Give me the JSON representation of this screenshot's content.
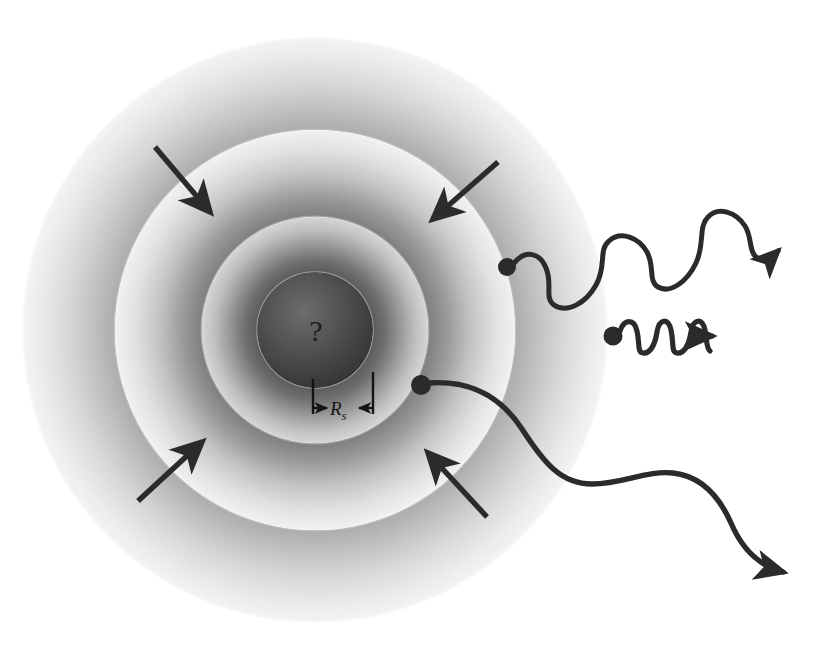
{
  "figure": {
    "kind": "gravitational-collapse-schematic",
    "background_color": "#ffffff",
    "ink_color": "#2b2b2b",
    "center": {
      "x": 315,
      "y": 330
    }
  },
  "core": {
    "label": "?",
    "label_x": 316,
    "label_y": 341,
    "radius": 58,
    "fill_dark": "#3a3a3a",
    "fill_light": "#6f6f6f"
  },
  "shells": [
    {
      "name": "outer-shell",
      "radius": 293,
      "inner_edge_color": "#b4b4b4",
      "outer_edge_color": "#f2f2f2"
    },
    {
      "name": "middle-shell",
      "radius": 200,
      "inner_edge_color": "#8d8d8d",
      "outer_edge_color": "#ededed"
    },
    {
      "name": "inner-shell",
      "radius": 113,
      "inner_edge_color": "#6a6a6a",
      "outer_edge_color": "#d6d6d6"
    }
  ],
  "dimension": {
    "label_text": "R",
    "label_subscript": "s",
    "label_x": 330,
    "label_y": 414,
    "meaning": "Schwarzschild radius",
    "left_tick_x": 313,
    "right_tick_x": 373,
    "baseline_y": 408,
    "tick_top_y": 378
  },
  "infall_arrows": [
    {
      "name": "infall-arrow-top-left",
      "x1": 155,
      "y1": 147,
      "x2": 214,
      "y2": 217,
      "direction": "down-right"
    },
    {
      "name": "infall-arrow-top-right",
      "x1": 498,
      "y1": 162,
      "x2": 429,
      "y2": 223,
      "direction": "down-left"
    },
    {
      "name": "infall-arrow-bottom-left",
      "x1": 138,
      "y1": 501,
      "x2": 206,
      "y2": 438,
      "direction": "up-right"
    },
    {
      "name": "infall-arrow-bottom-right",
      "x1": 487,
      "y1": 517,
      "x2": 424,
      "y2": 449,
      "direction": "up-left"
    }
  ],
  "photons": [
    {
      "name": "photon-upper",
      "wavelength": "medium",
      "emission_dot": {
        "x": 507,
        "y": 267,
        "r": 9
      },
      "arrow_tip": {
        "x": 794,
        "y": 69
      },
      "path": "M 515 264 C 527 250 540 254 546 268 C 553 284 545 298 554 305 C 566 314 585 304 595 286 C 606 267 598 251 608 242 C 620 231 638 238 646 252 C 654 266 648 280 657 286 C 669 294 686 283 695 264 C 704 245 698 228 707 218 C 717 207 735 212 744 226 C 751 237 748 249 754 255 C 760 261 768 260 777 252 L 786 244",
      "arrow_angle": -46
    },
    {
      "name": "photon-middle",
      "wavelength": "short",
      "emission_dot": {
        "x": 613,
        "y": 336,
        "r": 9
      },
      "arrow_tip": {
        "x": 707,
        "y": 336
      },
      "path": "M 621 333 C 625 322 633 320 637 330 C 641 340 638 350 643 352 C 649 355 655 346 657 334 C 659 322 666 318 671 327 C 676 336 673 348 678 351 C 684 354 690 345 692 333 C 694 321 701 318 706 327 C 710 335 707 347 712 350 L 714 351 L 690 336 Z",
      "straight_from": {
        "x": 676,
        "y": 336
      },
      "straight_to": {
        "x": 696,
        "y": 336
      },
      "arrow_angle": 0
    },
    {
      "name": "photon-lower",
      "wavelength": "long",
      "emission_dot": {
        "x": 421,
        "y": 385,
        "r": 10
      },
      "arrow_tip": {
        "x": 798,
        "y": 580
      },
      "path": "M 430 383 C 470 380 500 396 521 428 C 543 462 560 483 591 483 C 622 483 646 470 672 472 C 700 474 718 494 730 522 C 742 550 760 566 782 572",
      "arrow_angle": 24
    }
  ],
  "legend_text": {
    "core_unknown": "?",
    "radius_symbol": "R",
    "radius_subscript": "s"
  }
}
